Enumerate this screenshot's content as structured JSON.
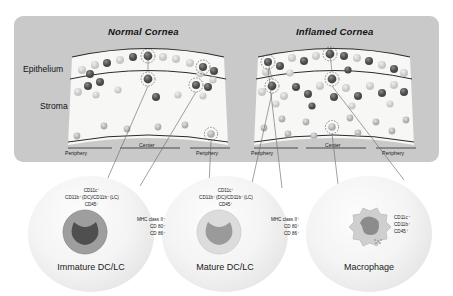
{
  "figure": {
    "panel": {
      "titles": {
        "normal": "Normal Cornea",
        "inflamed": "Inflamed Cornea"
      },
      "layers": {
        "epithelium": "Epithelium",
        "stroma": "Stroma"
      },
      "regions": {
        "periphery": "Periphery",
        "center": "Center"
      }
    },
    "cells": [
      {
        "id": "immature-dc-lc",
        "caption": "Immature DC/LC",
        "surface_markers": [
          "CD11c⁺",
          "CD11b⁺(DC)/CD11b⁻(LC)",
          "CD45⁺"
        ],
        "activation_markers": [
          "MHC class II⁻",
          "CD 80⁻",
          "CD 86⁻"
        ],
        "body_color": "#9e9e9e",
        "nucleus_color": "#4f4f4f",
        "shape": "round"
      },
      {
        "id": "mature-dc-lc",
        "caption": "Mature DC/LC",
        "surface_markers": [
          "CD11c⁺",
          "CD11b⁺(DC)/CD11b⁻(LC)",
          "CD45⁺"
        ],
        "activation_markers": [
          "MHC class II⁺",
          "CD 80⁺",
          "CD 86⁺"
        ],
        "body_color": "#d8d8d8",
        "nucleus_color": "#9a9a9a",
        "shape": "round"
      },
      {
        "id": "macrophage",
        "caption": "Macrophage",
        "surface_markers": [
          "CD11c⁻",
          "CD11b⁺",
          "CD45⁺"
        ],
        "activation_markers": [],
        "body_color": "#cfcfcf",
        "nucleus_color": "#8c8c8c",
        "shape": "ruffled"
      }
    ],
    "colors": {
      "panel_background": "#c9c9c9",
      "cornea_fill": "#f7f7f5",
      "outline": "#2b2b2b",
      "dark_cell": "#5d5d5d",
      "faded_cell": "#cdcdcd",
      "callout_line": "#6d6d6d"
    }
  }
}
